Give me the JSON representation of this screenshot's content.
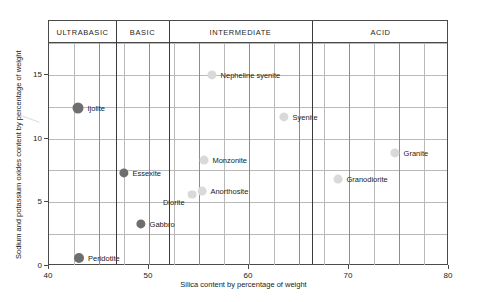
{
  "chart_data": {
    "type": "scatter",
    "title": "",
    "xlabel": "Silica content by percentage of weight",
    "ylabel": "Sodium and potassium oxides content by percentage of weight",
    "xlim": [
      40,
      80
    ],
    "ylim": [
      0,
      17.5
    ],
    "x_ticks": [
      40,
      50,
      60,
      70,
      80
    ],
    "x_tick_labels": [
      "40",
      "50",
      "60",
      "70",
      "80"
    ],
    "y_ticks": [
      0,
      5,
      10,
      15
    ],
    "y_tick_labels": [
      "0",
      "5",
      "10",
      "15"
    ],
    "x_gridlines": [
      42.5,
      45,
      47.5,
      50,
      52.5,
      55,
      57.5,
      60,
      62.5,
      65,
      67.5,
      70,
      72.5,
      75,
      77.5
    ],
    "y_gridlines": [
      2.5,
      5,
      7.5,
      10,
      12.5,
      15,
      17.5
    ],
    "grid": true,
    "legend": "none",
    "bands": [
      {
        "label": "ULTRABASIC",
        "start": 40,
        "end": 46.7
      },
      {
        "label": "BASIC",
        "start": 46.7,
        "end": 52.0
      },
      {
        "label": "INTERMEDIATE",
        "start": 52.0,
        "end": 66.3
      },
      {
        "label": "ACID",
        "start": 66.3,
        "end": 80
      }
    ],
    "points": [
      {
        "name": "Peridotite",
        "x": 43.0,
        "y": 0.6,
        "marker": "dark",
        "radius": 5.0,
        "label_pos": "right"
      },
      {
        "name": "Ijolite",
        "x": 42.9,
        "y": 12.4,
        "marker": "dark",
        "radius": 5.5,
        "label_pos": "right"
      },
      {
        "name": "Essexite",
        "x": 47.5,
        "y": 7.3,
        "marker": "dark",
        "radius": 4.6,
        "label_pos": "right"
      },
      {
        "name": "Gabbro",
        "x": 49.2,
        "y": 3.3,
        "marker": "dark",
        "radius": 4.6,
        "label_pos": "right"
      },
      {
        "name": "Diorite",
        "x": 54.3,
        "y": 5.6,
        "marker": "light",
        "radius": 4.4,
        "label_pos": "leftward"
      },
      {
        "name": "Anorthosite",
        "x": 55.3,
        "y": 5.9,
        "marker": "light",
        "radius": 4.4,
        "label_pos": "right"
      },
      {
        "name": "Monzonite",
        "x": 55.5,
        "y": 8.3,
        "marker": "light",
        "radius": 4.4,
        "label_pos": "right"
      },
      {
        "name": "Nepheline syenite",
        "x": 56.3,
        "y": 15.0,
        "marker": "light",
        "radius": 4.6,
        "label_pos": "right"
      },
      {
        "name": "Syenite",
        "x": 63.5,
        "y": 11.7,
        "marker": "light",
        "radius": 4.6,
        "label_pos": "right"
      },
      {
        "name": "Granodiorite",
        "x": 68.9,
        "y": 6.8,
        "marker": "light",
        "radius": 4.4,
        "label_pos": "right"
      },
      {
        "name": "Granite",
        "x": 74.6,
        "y": 8.9,
        "marker": "light",
        "radius": 4.6,
        "label_pos": "right"
      }
    ]
  },
  "colors": {
    "frame": "#4a4a4a",
    "grid": "#b9b9b9",
    "grid_major": "#8d8d8d",
    "divider": "#3a3a3a",
    "marker_dark": "#6e6e6e",
    "marker_light": "#d9d9d9",
    "text": "#1a1a1a",
    "background": "#ffffff"
  }
}
